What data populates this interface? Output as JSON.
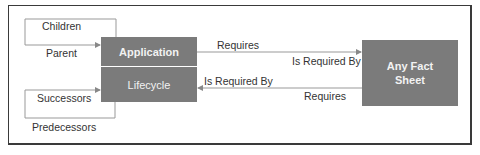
{
  "diagram": {
    "nodes": {
      "application": "Application",
      "lifecycle": "Lifecycle",
      "any_fact_sheet": "Any Fact Sheet"
    },
    "labels": {
      "children": "Children",
      "parent": "Parent",
      "successors": "Successors",
      "predecessors": "Predecessors",
      "requires_top": "Requires",
      "is_required_by_top": "Is Required By",
      "is_required_by_bottom": "Is Required By",
      "requires_bottom": "Requires"
    },
    "colors": {
      "node_fill": "#7b7b7b",
      "node_text": "#f2f2f2",
      "line": "#888888",
      "frame": "#3a3a3a"
    }
  }
}
